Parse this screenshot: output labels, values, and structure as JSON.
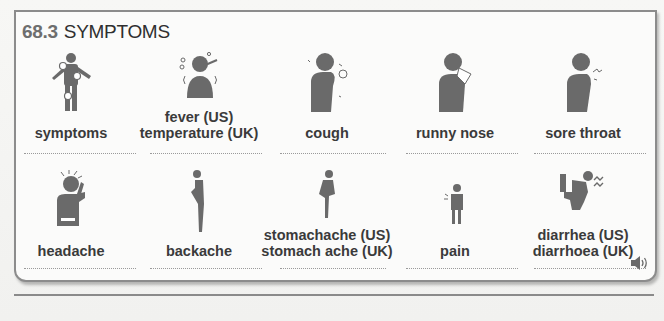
{
  "section": {
    "number": "68.3",
    "title": "SYMPTOMS"
  },
  "colors": {
    "icon_gray": "#6a6a6a",
    "text": "#3a3a3a",
    "border": "#8c8c8c"
  },
  "rows": [
    [
      {
        "label1": "",
        "label2": "symptoms",
        "icon": "body-pain-points-icon"
      },
      {
        "label1": "fever (US)",
        "label2": "temperature (UK)",
        "icon": "fever-thermometer-icon"
      },
      {
        "label1": "",
        "label2": "cough",
        "icon": "cough-icon"
      },
      {
        "label1": "",
        "label2": "runny nose",
        "icon": "runny-nose-tissue-icon"
      },
      {
        "label1": "",
        "label2": "sore throat",
        "icon": "sore-throat-icon"
      }
    ],
    [
      {
        "label1": "",
        "label2": "headache",
        "icon": "headache-icon"
      },
      {
        "label1": "",
        "label2": "backache",
        "icon": "backache-icon"
      },
      {
        "label1": "stomachache (US)",
        "label2": "stomach ache (UK)",
        "icon": "stomachache-icon"
      },
      {
        "label1": "",
        "label2": "pain",
        "icon": "pain-icon"
      },
      {
        "label1": "diarrhea (US)",
        "label2": "diarrhoea (UK)",
        "icon": "diarrhea-toilet-icon"
      }
    ]
  ],
  "audio": {
    "icon": "speaker-icon"
  }
}
